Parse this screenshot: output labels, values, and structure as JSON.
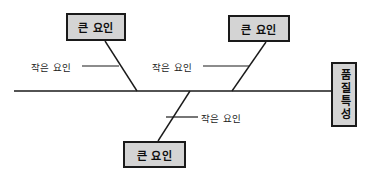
{
  "diagram": {
    "type": "fishbone-cause-and-effect",
    "title": "",
    "spine": {
      "x1": 14,
      "y1": 91,
      "x2": 331,
      "y2": 91,
      "color": "#1a1a1a"
    },
    "effect": {
      "label": "품질특성",
      "position": "right",
      "orientation": "vertical",
      "fill": "#d4d4d4",
      "stroke": "#1a1a1a"
    },
    "major_factors": [
      {
        "id": "major-1",
        "label": "큰 요인",
        "position": "top-left",
        "branch": {
          "x1": 105,
          "y1": 41,
          "x2": 137,
          "y2": 91
        }
      },
      {
        "id": "major-2",
        "label": "큰 요인",
        "position": "top-right",
        "branch": {
          "x1": 266,
          "y1": 42,
          "x2": 232,
          "y2": 91
        }
      },
      {
        "id": "major-3",
        "label": "큰 요인",
        "position": "bottom-center",
        "branch": {
          "x1": 190,
          "y1": 91,
          "x2": 158,
          "y2": 141
        }
      }
    ],
    "minor_factors": [
      {
        "id": "minor-1",
        "label": "작은 요인",
        "connector": {
          "x1": 82,
          "y1": 66,
          "x2": 119,
          "y2": 66
        }
      },
      {
        "id": "minor-2",
        "label": "작은 요인",
        "connector": {
          "x1": 203,
          "y1": 66,
          "x2": 249,
          "y2": 66
        }
      },
      {
        "id": "minor-3",
        "label": "작은 요인",
        "connector": {
          "x1": 166,
          "y1": 117,
          "x2": 198,
          "y2": 117
        }
      }
    ],
    "colors": {
      "box_fill": "#d4d4d4",
      "box_stroke": "#1a1a1a",
      "line": "#1a1a1a",
      "background": "#ffffff",
      "text": "#0d0d0d"
    }
  }
}
